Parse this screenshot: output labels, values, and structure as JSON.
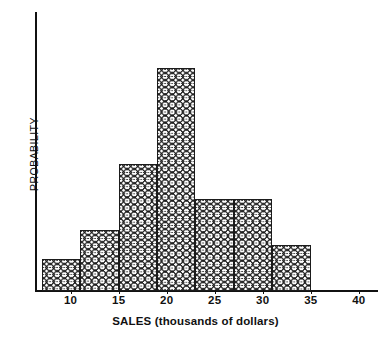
{
  "chart_data": {
    "type": "bar",
    "title": "",
    "subtitle": "",
    "xlabel": "SALES (thousands of dollars)",
    "ylabel": "PROBABILITY",
    "xlim": [
      6.5,
      42
    ],
    "ylim": [
      0,
      1
    ],
    "grid": false,
    "legend": null,
    "legend_position": "none",
    "bin_width": 4,
    "x_tick_labels": [
      "10",
      "15",
      "20",
      "25",
      "30",
      "35",
      "40"
    ],
    "x_tick_values": [
      10,
      15,
      20,
      25,
      30,
      35,
      40
    ],
    "y_tick_labels": [],
    "categories": [
      "7-11",
      "11-15",
      "15-19",
      "19-23",
      "23-27",
      "27-31",
      "31-35"
    ],
    "bin_edges": [
      7,
      11,
      15,
      19,
      23,
      27,
      31,
      35
    ],
    "bar_centers": [
      9,
      13,
      17,
      21,
      25,
      29,
      33
    ],
    "values": [
      0.115,
      0.22,
      0.455,
      0.8,
      0.33,
      0.33,
      0.165
    ],
    "bars": [
      {
        "label": "7-11",
        "center": 9,
        "value": 0.115
      },
      {
        "label": "11-15",
        "center": 13,
        "value": 0.22
      },
      {
        "label": "15-19",
        "center": 17,
        "value": 0.455
      },
      {
        "label": "19-23",
        "center": 21,
        "value": 0.8
      },
      {
        "label": "23-27",
        "center": 25,
        "value": 0.33
      },
      {
        "label": "27-31",
        "center": 29,
        "value": 0.33
      },
      {
        "label": "31-35",
        "center": 33,
        "value": 0.165
      }
    ],
    "bar_style": {
      "fill": "crosshatch",
      "fill_color": "#ffffff",
      "hatch_color": "#1b1b1b",
      "edge_color": "#1b1b1b"
    },
    "axis_color": "#111111",
    "background_color": "#ffffff"
  }
}
